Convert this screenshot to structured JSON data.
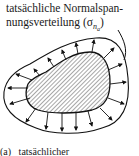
{
  "label": {
    "line1": "tatsächliche Normalspan-",
    "line2": "nungsverteilung (σ",
    "sub": "n",
    "subsub": "a",
    "close": ")"
  },
  "caption": {
    "marker": "(a)",
    "text": "tatsächlicher"
  }
}
